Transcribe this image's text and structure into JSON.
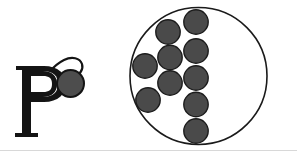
{
  "figure": {
    "background_color": "#ffffff",
    "width": 297,
    "height": 151,
    "bottom_border_color": "#d8d8d8"
  },
  "left_mark": {
    "name": "p-character-mark",
    "letter": "P",
    "letter_color": "#141414",
    "description": "Bold serif letter P with two small white square eyes inside the bowl and a white speech-bubble tail curving to the upper right",
    "eyes": {
      "name": "eye-dots",
      "count": 2,
      "color": "#ffffff"
    },
    "bubble_tail": {
      "name": "speech-bubble-tail",
      "fill_color": "#ffffff",
      "stroke_color": "#141414"
    },
    "ball": {
      "name": "gray-ball",
      "fill_color": "#4d4d4d",
      "stroke_color": "#141414",
      "cx": 70.5,
      "cy": 83.5,
      "r": 13.5
    }
  },
  "right_mark": {
    "name": "dotted-circle-mark",
    "outline_circle": {
      "name": "outer-circle",
      "cx": 198.5,
      "cy": 76.0,
      "r": 68.5,
      "stroke_color": "#1a1a1a",
      "stroke_width": 1.6,
      "fill_color": "#ffffff"
    },
    "dot_style": {
      "fill_color": "#4a4a4a",
      "stroke_color": "#1c1c1c",
      "stroke_width": 1.4,
      "radius": 12.2
    },
    "dot_count": 10,
    "dots": [
      {
        "name": "dot-1",
        "cx": 196.0,
        "cy": 22.0
      },
      {
        "name": "dot-2",
        "cx": 168.0,
        "cy": 32.0
      },
      {
        "name": "dot-3",
        "cx": 196.0,
        "cy": 51.0
      },
      {
        "name": "dot-4",
        "cx": 170.0,
        "cy": 57.5
      },
      {
        "name": "dot-5",
        "cx": 145.0,
        "cy": 66.0
      },
      {
        "name": "dot-6",
        "cx": 196.0,
        "cy": 78.0
      },
      {
        "name": "dot-7",
        "cx": 170.0,
        "cy": 83.0
      },
      {
        "name": "dot-8",
        "cx": 148.0,
        "cy": 100.0
      },
      {
        "name": "dot-9",
        "cx": 196.0,
        "cy": 104.5
      },
      {
        "name": "dot-10",
        "cx": 196.0,
        "cy": 131.0
      }
    ]
  }
}
